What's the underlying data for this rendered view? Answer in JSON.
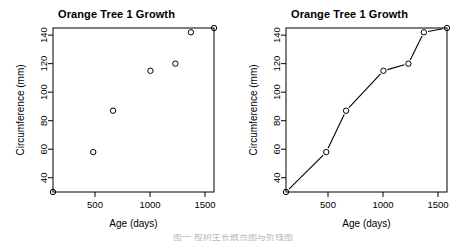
{
  "figure": {
    "width": 466,
    "height": 248,
    "background": "#ffffff",
    "foreground": "#000000",
    "caption": "图一 橙树生长散点图与折线图"
  },
  "chart_data": [
    {
      "type": "scatter",
      "panel": "left",
      "title": "Orange Tree 1 Growth",
      "xlabel": "Age (days)",
      "ylabel": "Circumference (mm)",
      "x": [
        118,
        484,
        664,
        1004,
        1231,
        1372,
        1582
      ],
      "values": [
        30,
        58,
        87,
        115,
        120,
        142,
        145
      ],
      "xlim": [
        118,
        1582
      ],
      "ylim": [
        30,
        145
      ],
      "xticks": [
        500,
        1000,
        1500
      ],
      "xticklabels": [
        "500",
        "1000",
        "1500"
      ],
      "yticks": [
        40,
        60,
        80,
        100,
        120,
        140
      ],
      "yticklabels": [
        "40",
        "60",
        "80",
        "100",
        "120",
        "140"
      ],
      "grid": false,
      "legend": null,
      "marker": "open-circle",
      "marker_color": "#000000",
      "line": false
    },
    {
      "type": "line",
      "panel": "right",
      "title": "Orange Tree 1 Growth",
      "xlabel": "Age (days)",
      "ylabel": "Circumference (mm)",
      "x": [
        118,
        484,
        664,
        1004,
        1231,
        1372,
        1582
      ],
      "values": [
        30,
        58,
        87,
        115,
        120,
        142,
        145
      ],
      "xlim": [
        118,
        1582
      ],
      "ylim": [
        30,
        145
      ],
      "xticks": [
        500,
        1000,
        1500
      ],
      "xticklabels": [
        "500",
        "1000",
        "1500"
      ],
      "yticks": [
        40,
        60,
        80,
        100,
        120,
        140
      ],
      "yticklabels": [
        "40",
        "60",
        "80",
        "100",
        "120",
        "140"
      ],
      "grid": false,
      "legend": null,
      "marker": "open-circle",
      "marker_color": "#000000",
      "line": true,
      "line_color": "#000000"
    }
  ],
  "panels": {
    "left": {
      "title": "Orange Tree 1 Growth",
      "xlabel": "Age (days)",
      "ylabel": "Circumference (mm)"
    },
    "right": {
      "title": "Orange Tree 1 Growth",
      "xlabel": "Age (days)",
      "ylabel": "Circumference (mm)"
    }
  }
}
